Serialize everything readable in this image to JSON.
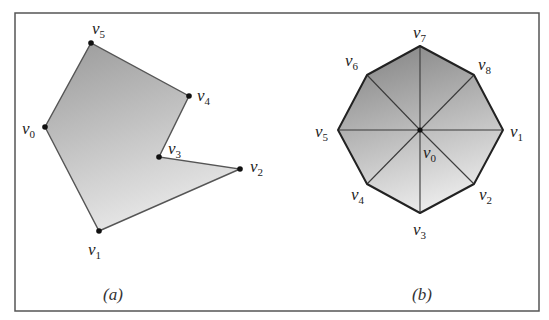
{
  "figure": {
    "frame": {
      "x": 15,
      "y": 13,
      "width": 524,
      "height": 298,
      "stroke": "#555555"
    },
    "panels": [
      {
        "id": "a",
        "caption": "(a)",
        "caption_pos": [
          113,
          300
        ],
        "shape": "concave-hexagon",
        "fill_top": "#9a9a9a",
        "fill_bottom": "#e6e6e6",
        "vertices": [
          {
            "name": "v0",
            "base": "v",
            "sub": "0",
            "x": 45,
            "y": 127,
            "label_x": 22,
            "label_y": 134
          },
          {
            "name": "v1",
            "base": "v",
            "sub": "1",
            "x": 99,
            "y": 231,
            "label_x": 88,
            "label_y": 255
          },
          {
            "name": "v2",
            "base": "v",
            "sub": "2",
            "x": 240,
            "y": 169,
            "label_x": 250,
            "label_y": 172
          },
          {
            "name": "v3",
            "base": "v",
            "sub": "3",
            "x": 159,
            "y": 157,
            "label_x": 168,
            "label_y": 154
          },
          {
            "name": "v4",
            "base": "v",
            "sub": "4",
            "x": 189,
            "y": 96,
            "label_x": 197,
            "label_y": 101
          },
          {
            "name": "v5",
            "base": "v",
            "sub": "5",
            "x": 91,
            "y": 43,
            "label_x": 92,
            "label_y": 34
          }
        ]
      },
      {
        "id": "b",
        "caption": "(b)",
        "caption_pos": [
          422,
          300
        ],
        "shape": "octagon-fan",
        "fill_top": "#858585",
        "fill_bottom": "#ececec",
        "center": {
          "name": "v0",
          "base": "v",
          "sub": "0",
          "x": 420,
          "y": 130,
          "label_x": 423,
          "label_y": 158
        },
        "vertices": [
          {
            "name": "v1",
            "base": "v",
            "sub": "1",
            "x": 503,
            "y": 130,
            "label_x": 510,
            "label_y": 137
          },
          {
            "name": "v2",
            "base": "v",
            "sub": "2",
            "x": 474,
            "y": 184,
            "label_x": 479,
            "label_y": 200
          },
          {
            "name": "v3",
            "base": "v",
            "sub": "3",
            "x": 420,
            "y": 213,
            "label_x": 413,
            "label_y": 235
          },
          {
            "name": "v4",
            "base": "v",
            "sub": "4",
            "x": 367,
            "y": 184,
            "label_x": 351,
            "label_y": 200
          },
          {
            "name": "v5",
            "base": "v",
            "sub": "5",
            "x": 338,
            "y": 130,
            "label_x": 315,
            "label_y": 137
          },
          {
            "name": "v6",
            "base": "v",
            "sub": "6",
            "x": 367,
            "y": 75,
            "label_x": 345,
            "label_y": 66
          },
          {
            "name": "v7",
            "base": "v",
            "sub": "7",
            "x": 420,
            "y": 46,
            "label_x": 413,
            "label_y": 38
          },
          {
            "name": "v8",
            "base": "v",
            "sub": "8",
            "x": 474,
            "y": 75,
            "label_x": 478,
            "label_y": 70
          }
        ]
      }
    ]
  }
}
